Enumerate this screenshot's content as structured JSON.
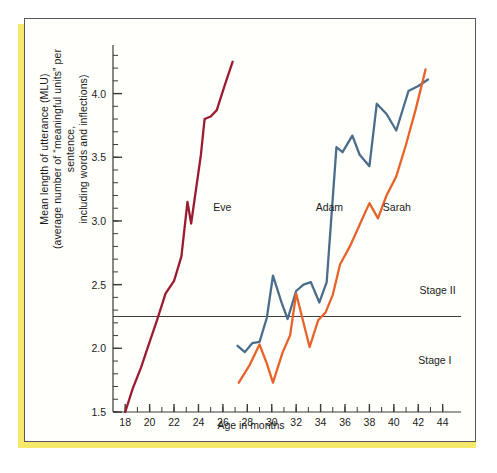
{
  "figure": {
    "background_color": "#fffffb",
    "frame_color": "#58585a",
    "page_edge_color": "#f5e96b"
  },
  "chart_data": {
    "type": "line",
    "title": "",
    "xlabel": "Age in months",
    "ylabel": "Mean length of utterance (MLU)\n(average number of “meaningful units” per sentence,\nincluding words and inflections)",
    "ylabel_line1": "Mean length of utterance (MLU)",
    "ylabel_line2": "(average number of “meaningful units” per sentence,",
    "ylabel_line3": "including words and inflections)",
    "xlim": [
      17,
      45.5
    ],
    "ylim": [
      1.5,
      4.35
    ],
    "grid": false,
    "legend_position": "inline-annotations",
    "x_major_ticks": [
      18,
      20,
      22,
      24,
      26,
      28,
      30,
      32,
      34,
      36,
      38,
      40,
      42,
      44
    ],
    "x_tick_labels": [
      "18",
      "20",
      "22",
      "24",
      "26",
      "28",
      "30",
      "32",
      "34",
      "36",
      "38",
      "40",
      "42",
      "44"
    ],
    "x_minor_step": 1,
    "y_major_ticks": [
      1.5,
      2.0,
      2.5,
      3.0,
      3.5,
      4.0
    ],
    "y_tick_labels": [
      "1.5",
      "2.0",
      "2.5",
      "3.0",
      "3.5",
      "4.0"
    ],
    "y_minor_step": 0.1,
    "reference_lines": [
      {
        "name": "stage-divider",
        "value": 2.25,
        "orientation": "horizontal",
        "color": "#3a3a3a",
        "label_above": "Stage II",
        "label_below": "Stage I"
      }
    ],
    "annotations": [
      {
        "text": "Eve",
        "x": 25.2,
        "y": 3.08,
        "color": "#1b1b1b"
      },
      {
        "text": "Adam",
        "x": 33.6,
        "y": 3.08,
        "color": "#1b1b1b"
      },
      {
        "text": "Sarah",
        "x": 39.1,
        "y": 3.08,
        "color": "#1b1b1b"
      },
      {
        "text": "Stage II",
        "x": 42.1,
        "y": 2.43,
        "color": "#1b1b1b"
      },
      {
        "text": "Stage I",
        "x": 42.0,
        "y": 1.88,
        "color": "#1b1b1b"
      }
    ],
    "series": [
      {
        "name": "Eve",
        "color": "#9b1b30",
        "x": [
          18.0,
          18.6,
          19.3,
          20.0,
          20.6,
          21.3,
          22.0,
          22.6,
          23.1,
          23.4,
          24.2,
          24.5,
          25.0,
          25.5,
          26.1,
          26.8
        ],
        "y": [
          1.5,
          1.68,
          1.85,
          2.05,
          2.22,
          2.43,
          2.53,
          2.72,
          3.15,
          2.98,
          3.52,
          3.8,
          3.82,
          3.87,
          4.05,
          4.25
        ]
      },
      {
        "name": "Adam",
        "color": "#4a6d8c",
        "x": [
          27.2,
          27.8,
          28.4,
          29.0,
          29.6,
          30.1,
          30.8,
          31.3,
          32.0,
          32.6,
          33.2,
          33.9,
          34.5,
          35.3,
          35.8,
          36.6,
          37.2,
          38.0,
          38.6,
          39.4,
          40.2,
          41.2,
          42.0,
          42.8
        ],
        "y": [
          2.02,
          1.97,
          2.04,
          2.05,
          2.24,
          2.57,
          2.36,
          2.23,
          2.45,
          2.5,
          2.52,
          2.36,
          2.52,
          3.58,
          3.54,
          3.67,
          3.52,
          3.43,
          3.92,
          3.84,
          3.71,
          4.02,
          4.06,
          4.11
        ]
      },
      {
        "name": "Sarah",
        "color": "#e8632a",
        "x": [
          27.3,
          28.2,
          29.0,
          29.6,
          30.1,
          30.9,
          31.5,
          32.0,
          32.6,
          33.1,
          33.8,
          34.4,
          35.0,
          35.6,
          36.4,
          37.2,
          38.0,
          38.7,
          39.4,
          40.2,
          41.0,
          41.8,
          42.6
        ],
        "y": [
          1.73,
          1.87,
          2.03,
          1.88,
          1.73,
          1.97,
          2.1,
          2.43,
          2.2,
          2.01,
          2.22,
          2.28,
          2.42,
          2.66,
          2.8,
          2.97,
          3.14,
          3.02,
          3.2,
          3.35,
          3.6,
          3.88,
          4.19
        ]
      }
    ]
  }
}
